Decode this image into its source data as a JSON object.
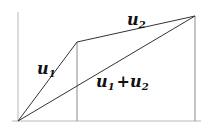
{
  "diagram": {
    "colors": {
      "axis": "#b8b8b8",
      "drop": "#8a8a8a",
      "vector": "#333333",
      "text": "#111111"
    },
    "points": {
      "origin": [
        18,
        121
      ],
      "u1_tip": [
        77,
        42
      ],
      "sum_tip": [
        195,
        16
      ]
    },
    "labels": {
      "u1": {
        "base": "u",
        "sub": "1"
      },
      "u2": {
        "base": "u",
        "sub": "2"
      },
      "sum": {
        "base1": "u",
        "sub1": "1",
        "plus": "+",
        "base2": "u",
        "sub2": "2"
      }
    }
  }
}
